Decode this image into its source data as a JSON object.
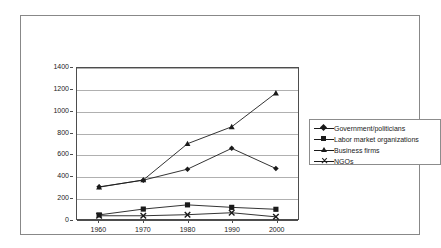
{
  "chart_data": {
    "type": "line",
    "title": "",
    "xlabel": "",
    "ylabel": "",
    "categories": [
      "1960",
      "1970",
      "1980",
      "1990",
      "2000"
    ],
    "x": [
      1960,
      1970,
      1980,
      1990,
      2000
    ],
    "ylim": [
      0,
      1400
    ],
    "ytick_step": 200,
    "yticks": [
      "0",
      "200",
      "400",
      "600",
      "800",
      "1000",
      "1200",
      "1400"
    ],
    "grid": true,
    "legend_position": "right",
    "series": [
      {
        "name": "Government/politicians",
        "marker": "diamond",
        "values": [
          298,
          360,
          462,
          655,
          468
        ]
      },
      {
        "name": "Labor market organizations",
        "marker": "square",
        "values": [
          38,
          92,
          131,
          108,
          90
        ]
      },
      {
        "name": "Business firms",
        "marker": "triangle",
        "values": [
          295,
          362,
          698,
          855,
          1168
        ]
      },
      {
        "name": "NGOs",
        "marker": "x",
        "values": [
          30,
          30,
          40,
          58,
          20
        ]
      }
    ],
    "colors": {
      "series_line": "#1a1a1a",
      "gridline": "#b0b0b0",
      "axis": "#4d4d4d",
      "frame": "#888888",
      "background": "#ffffff",
      "text": "#1a1a1a"
    }
  }
}
